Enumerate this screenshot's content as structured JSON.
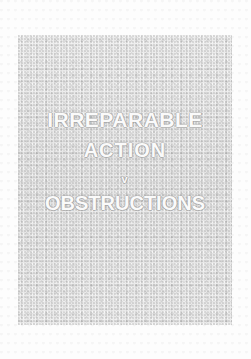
{
  "cover": {
    "background_color": "#ffffff",
    "panel_color": "#e8e8e8",
    "text_color": "#fafafa",
    "title_lines": [
      "IRREPARABLE",
      "ACTION",
      "v",
      "OBSTRUCTIONS"
    ]
  }
}
